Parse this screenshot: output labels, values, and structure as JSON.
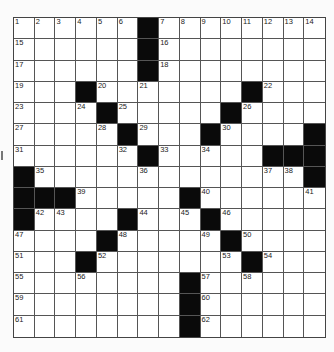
{
  "puzzle": {
    "rows": 15,
    "cols": 15,
    "black_cells": [
      [
        0,
        6
      ],
      [
        1,
        6
      ],
      [
        2,
        6
      ],
      [
        3,
        3
      ],
      [
        3,
        11
      ],
      [
        4,
        4
      ],
      [
        4,
        10
      ],
      [
        5,
        5
      ],
      [
        5,
        9
      ],
      [
        5,
        14
      ],
      [
        6,
        6
      ],
      [
        6,
        12
      ],
      [
        6,
        13
      ],
      [
        6,
        14
      ],
      [
        7,
        0
      ],
      [
        7,
        14
      ],
      [
        8,
        0
      ],
      [
        8,
        1
      ],
      [
        8,
        2
      ],
      [
        8,
        8
      ],
      [
        9,
        0
      ],
      [
        9,
        5
      ],
      [
        9,
        9
      ],
      [
        10,
        4
      ],
      [
        10,
        10
      ],
      [
        11,
        3
      ],
      [
        11,
        11
      ],
      [
        12,
        8
      ],
      [
        13,
        8
      ],
      [
        14,
        8
      ]
    ],
    "numbers": [
      {
        "r": 0,
        "c": 0,
        "n": "1"
      },
      {
        "r": 0,
        "c": 1,
        "n": "2"
      },
      {
        "r": 0,
        "c": 2,
        "n": "3"
      },
      {
        "r": 0,
        "c": 3,
        "n": "4"
      },
      {
        "r": 0,
        "c": 4,
        "n": "5"
      },
      {
        "r": 0,
        "c": 5,
        "n": "6"
      },
      {
        "r": 0,
        "c": 7,
        "n": "7"
      },
      {
        "r": 0,
        "c": 8,
        "n": "8"
      },
      {
        "r": 0,
        "c": 9,
        "n": "9"
      },
      {
        "r": 0,
        "c": 10,
        "n": "10"
      },
      {
        "r": 0,
        "c": 11,
        "n": "11"
      },
      {
        "r": 0,
        "c": 12,
        "n": "12"
      },
      {
        "r": 0,
        "c": 13,
        "n": "13"
      },
      {
        "r": 0,
        "c": 14,
        "n": "14"
      },
      {
        "r": 1,
        "c": 0,
        "n": "15"
      },
      {
        "r": 1,
        "c": 7,
        "n": "16"
      },
      {
        "r": 2,
        "c": 0,
        "n": "17"
      },
      {
        "r": 2,
        "c": 7,
        "n": "18"
      },
      {
        "r": 3,
        "c": 0,
        "n": "19"
      },
      {
        "r": 3,
        "c": 4,
        "n": "20"
      },
      {
        "r": 3,
        "c": 6,
        "n": "21"
      },
      {
        "r": 3,
        "c": 12,
        "n": "22"
      },
      {
        "r": 4,
        "c": 0,
        "n": "23"
      },
      {
        "r": 4,
        "c": 3,
        "n": "24"
      },
      {
        "r": 4,
        "c": 5,
        "n": "25"
      },
      {
        "r": 4,
        "c": 11,
        "n": "26"
      },
      {
        "r": 5,
        "c": 0,
        "n": "27"
      },
      {
        "r": 5,
        "c": 4,
        "n": "28"
      },
      {
        "r": 5,
        "c": 6,
        "n": "29"
      },
      {
        "r": 5,
        "c": 10,
        "n": "30"
      },
      {
        "r": 6,
        "c": 0,
        "n": "31"
      },
      {
        "r": 6,
        "c": 5,
        "n": "32"
      },
      {
        "r": 6,
        "c": 7,
        "n": "33"
      },
      {
        "r": 6,
        "c": 9,
        "n": "34"
      },
      {
        "r": 7,
        "c": 1,
        "n": "35"
      },
      {
        "r": 7,
        "c": 6,
        "n": "36"
      },
      {
        "r": 7,
        "c": 12,
        "n": "37"
      },
      {
        "r": 7,
        "c": 13,
        "n": "38"
      },
      {
        "r": 8,
        "c": 3,
        "n": "39"
      },
      {
        "r": 8,
        "c": 9,
        "n": "40"
      },
      {
        "r": 8,
        "c": 14,
        "n": "41"
      },
      {
        "r": 9,
        "c": 1,
        "n": "42"
      },
      {
        "r": 9,
        "c": 2,
        "n": "43"
      },
      {
        "r": 9,
        "c": 6,
        "n": "44"
      },
      {
        "r": 9,
        "c": 8,
        "n": "45"
      },
      {
        "r": 9,
        "c": 10,
        "n": "46"
      },
      {
        "r": 10,
        "c": 0,
        "n": "47"
      },
      {
        "r": 10,
        "c": 5,
        "n": "48"
      },
      {
        "r": 10,
        "c": 9,
        "n": "49"
      },
      {
        "r": 10,
        "c": 11,
        "n": "50"
      },
      {
        "r": 11,
        "c": 0,
        "n": "51"
      },
      {
        "r": 11,
        "c": 4,
        "n": "52"
      },
      {
        "r": 11,
        "c": 10,
        "n": "53"
      },
      {
        "r": 11,
        "c": 12,
        "n": "54"
      },
      {
        "r": 12,
        "c": 0,
        "n": "55"
      },
      {
        "r": 12,
        "c": 3,
        "n": "56"
      },
      {
        "r": 12,
        "c": 9,
        "n": "57"
      },
      {
        "r": 12,
        "c": 11,
        "n": "58"
      },
      {
        "r": 13,
        "c": 0,
        "n": "59"
      },
      {
        "r": 13,
        "c": 9,
        "n": "60"
      },
      {
        "r": 14,
        "c": 0,
        "n": "61"
      },
      {
        "r": 14,
        "c": 9,
        "n": "62"
      }
    ],
    "colors": {
      "black": "#0a0a0a",
      "white": "#ffffff",
      "line": "#555555"
    }
  }
}
